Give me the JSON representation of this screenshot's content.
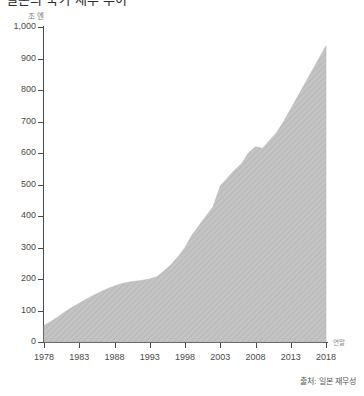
{
  "title": "일본의 국가 채무 추이",
  "y_unit_label": "조 엔",
  "x_end_label": "연말",
  "source": "출처: 일본 재무성",
  "colors": {
    "area_fill": "#bfbfbf",
    "area_hatch": "#b2b2b2",
    "axis": "#4a4a4a",
    "text": "#4a4a4a",
    "muted_text": "#8a8a8a"
  },
  "chart_data": {
    "type": "area",
    "title": "일본의 국가 채무 추이",
    "xlabel": "연말",
    "ylabel": "조 엔",
    "xlim": [
      1978,
      2018
    ],
    "ylim": [
      0,
      1000
    ],
    "grid": false,
    "legend": "none",
    "y_ticks": [
      "0",
      "100",
      "200",
      "300",
      "400",
      "500",
      "600",
      "700",
      "800",
      "900",
      "1,000"
    ],
    "y_tick_values": [
      0,
      100,
      200,
      300,
      400,
      500,
      600,
      700,
      800,
      900,
      1000
    ],
    "x_ticks": [
      "1978",
      "1983",
      "1988",
      "1993",
      "1998",
      "2003",
      "2008",
      "2013",
      "2018"
    ],
    "x_tick_values": [
      1978,
      1983,
      1988,
      1993,
      1998,
      2003,
      2008,
      2013,
      2018
    ],
    "x": [
      1978,
      1979,
      1980,
      1981,
      1982,
      1983,
      1984,
      1985,
      1986,
      1987,
      1988,
      1989,
      1990,
      1991,
      1992,
      1993,
      1994,
      1995,
      1996,
      1997,
      1998,
      1999,
      2000,
      2001,
      2002,
      2003,
      2004,
      2005,
      2006,
      2007,
      2008,
      2009,
      2010,
      2011,
      2012,
      2013,
      2014,
      2015,
      2016,
      2017,
      2018
    ],
    "values": [
      52,
      65,
      80,
      96,
      110,
      123,
      136,
      148,
      159,
      169,
      178,
      185,
      190,
      193,
      196,
      200,
      207,
      225,
      245,
      270,
      300,
      340,
      370,
      400,
      430,
      495,
      520,
      545,
      565,
      600,
      620,
      615,
      640,
      665,
      700,
      740,
      780,
      820,
      860,
      900,
      940
    ],
    "annotations": [
      {
        "label": "1990년 전후 정체 구간",
        "x_range": [
          1988,
          1993
        ]
      },
      {
        "label": "2003년 급증 이후 조정",
        "x_range": [
          2002,
          2004
        ]
      },
      {
        "label": "2008년 이후 완만한 단차",
        "x_range": [
          2007,
          2009
        ]
      }
    ]
  }
}
